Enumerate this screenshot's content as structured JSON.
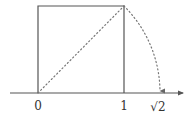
{
  "diagram": {
    "colors": {
      "stroke": "#555555",
      "dotted": "#777777",
      "text": "#333333",
      "background": "#ffffff"
    },
    "axis": {
      "labels": [
        {
          "text": "0",
          "value": 0
        },
        {
          "text": "1",
          "value": 1
        },
        {
          "text": "√2",
          "value": 1.41421
        }
      ]
    },
    "shapes": {
      "square": {
        "side": 1
      },
      "diagonal": {
        "style": "dotted",
        "length": "√2"
      },
      "arc": {
        "style": "dotted",
        "center": 0,
        "radius": "√2",
        "arrow": true
      }
    }
  }
}
